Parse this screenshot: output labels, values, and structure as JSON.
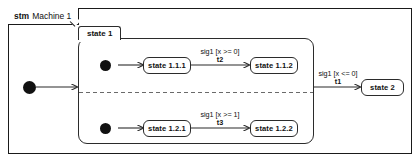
{
  "frame": {
    "keyword": "stm",
    "title": "Machine 1"
  },
  "composite_state": {
    "name": "state 1"
  },
  "states": [
    {
      "id": "state-1-1-1",
      "label": "state 1.1.1"
    },
    {
      "id": "state-1-1-2",
      "label": "state 1.1.2"
    },
    {
      "id": "state-1-2-1",
      "label": "state 1.2.1"
    },
    {
      "id": "state-1-2-2",
      "label": "state 1.2.2"
    },
    {
      "id": "state-2",
      "label": "state 2"
    }
  ],
  "transitions": [
    {
      "id": "t2",
      "guard": "sig1 [x >= 0]",
      "name": "t2"
    },
    {
      "id": "t3",
      "guard": "sig1 [x >= 1]",
      "name": "t3"
    },
    {
      "id": "t1",
      "guard": "sig1 [x <= 0]",
      "name": "t1"
    }
  ],
  "pseudostates": {
    "machine_initial": "initial-pseudostate",
    "region1_initial": "initial-pseudostate",
    "region2_initial": "initial-pseudostate"
  },
  "region_divider": "orthogonal-region-divider"
}
